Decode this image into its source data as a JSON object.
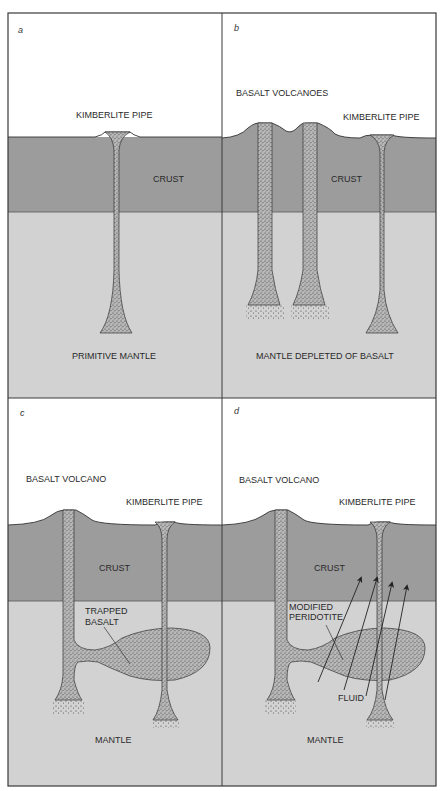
{
  "page_header": "",
  "colors": {
    "sky": "#ffffff",
    "crust": "#9c9c9c",
    "mantle": "#d2d2d2",
    "magma": "#b4b4b4",
    "stipple": "#333333",
    "border": "#3a3a3a"
  },
  "panels": [
    {
      "id": "a",
      "letter": "a",
      "labels": {
        "kimberlite": "KIMBERLITE PIPE",
        "crust": "CRUST",
        "mantle": "PRIMITIVE MANTLE"
      }
    },
    {
      "id": "b",
      "letter": "b",
      "labels": {
        "basalt": "BASALT VOLCANOES",
        "kimberlite": "KIMBERLITE PIPE",
        "crust": "CRUST",
        "mantle": "MANTLE DEPLETED OF BASALT"
      }
    },
    {
      "id": "c",
      "letter": "c",
      "labels": {
        "basalt": "BASALT VOLCANO",
        "kimberlite": "KIMBERLITE PIPE",
        "crust": "CRUST",
        "trapped_1": "TRAPPED",
        "trapped_2": "BASALT",
        "mantle": "MANTLE"
      }
    },
    {
      "id": "d",
      "letter": "d",
      "labels": {
        "basalt": "BASALT VOLCANO",
        "kimberlite": "KIMBERLITE PIPE",
        "crust": "CRUST",
        "modified_1": "MODIFIED",
        "modified_2": "PERIDOTITE",
        "fluid": "FLUID",
        "mantle": "MANTLE"
      }
    }
  ]
}
